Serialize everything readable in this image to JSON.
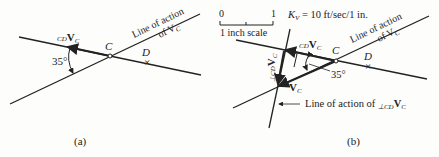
{
  "panel_a": {
    "caption": "(a)",
    "angle": "35°",
    "point_c": "C",
    "point_d": "D",
    "vector_label_pre": "CD",
    "vector_label_main": "V",
    "vector_label_sub": "C",
    "line_of_action_1": "Line of action",
    "line_of_action_2": "of V",
    "line_of_action_sub": "C"
  },
  "panel_b": {
    "caption": "(b)",
    "scale_zero": "0",
    "scale_one": "1",
    "scale_label": "1 inch scale",
    "kv_label": "K",
    "kv_sub": "V",
    "kv_value": " = 10 ft/sec/1 in.",
    "angle": "35°",
    "point_c": "C",
    "point_d": "D",
    "cd_pre": "CD",
    "cd_main": "V",
    "cd_sub": "C",
    "perp_pre": "⊥CD",
    "perp_main": "V",
    "perp_sub": "C",
    "vc_main": "V",
    "vc_sub": "C",
    "line_of_action_1": "Line of action",
    "line_of_action_2": "of V",
    "line_of_action_sub": "C",
    "perp_line_label": "Line of action of ",
    "perp_line_pre": "⊥CD",
    "perp_line_main": "V",
    "perp_line_sub": "C"
  }
}
